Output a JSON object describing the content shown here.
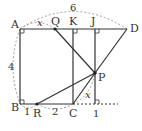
{
  "figure": {
    "points": {
      "A": {
        "label": "A",
        "x": 20,
        "y": 29
      },
      "B": {
        "label": "B",
        "x": 20,
        "y": 104
      },
      "C": {
        "label": "C",
        "x": 73,
        "y": 104
      },
      "D": {
        "label": "D",
        "x": 127,
        "y": 29
      },
      "Q": {
        "label": "Q",
        "x": 55,
        "y": 29
      },
      "K": {
        "label": "K",
        "x": 73,
        "y": 29
      },
      "J": {
        "label": "J",
        "x": 95,
        "y": 29
      },
      "P": {
        "label": "P",
        "x": 95,
        "y": 73
      },
      "R": {
        "label": "R",
        "x": 37,
        "y": 104
      },
      "I": {
        "label": "I",
        "x": 95,
        "y": 104
      }
    },
    "measures": {
      "AD": "6",
      "AB": "4",
      "AQ": "x",
      "CP": "x",
      "BR": "1",
      "RC": "2",
      "CI": "1"
    }
  }
}
